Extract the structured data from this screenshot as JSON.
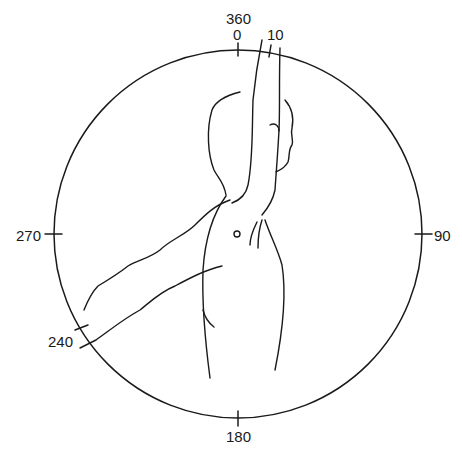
{
  "diagram": {
    "type": "range-of-motion-dial",
    "labels": {
      "top_outer": "360",
      "top_inner": "0",
      "top_right": "10",
      "right": "90",
      "bottom": "180",
      "left": "270",
      "lower_left": "240"
    },
    "colors": {
      "line": "#1a1a1a",
      "background": "#ffffff"
    }
  }
}
